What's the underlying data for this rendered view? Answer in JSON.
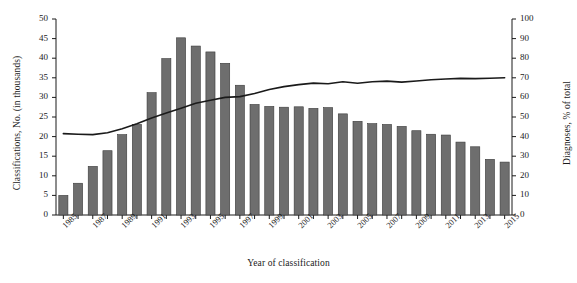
{
  "chart_data": {
    "type": "bar",
    "title": "",
    "xlabel": "Year of classification",
    "ylabel": "Classifications, No. (in thousands)",
    "ylabel_right": "Diagnoses, % of total",
    "ylim": [
      0,
      50
    ],
    "ylim_right": [
      0,
      100
    ],
    "yticks": [
      0,
      5,
      10,
      15,
      20,
      25,
      30,
      35,
      40,
      45,
      50
    ],
    "yticks_right": [
      0,
      10,
      20,
      30,
      40,
      50,
      60,
      70,
      80,
      90,
      100
    ],
    "grid": false,
    "legend": "none",
    "categories": [
      1985,
      1986,
      1987,
      1988,
      1989,
      1990,
      1991,
      1992,
      1993,
      1994,
      1995,
      1996,
      1997,
      1998,
      1999,
      2000,
      2001,
      2002,
      2003,
      2004,
      2005,
      2006,
      2007,
      2008,
      2009,
      2010,
      2011,
      2012,
      2013,
      2014,
      2015
    ],
    "xtick_labels": [
      "1985",
      "1987",
      "1989",
      "1991",
      "1993",
      "1995",
      "1997",
      "1999",
      "2001",
      "2003",
      "2005",
      "2007",
      "2009",
      "2011",
      "2013",
      "2015"
    ],
    "series": [
      {
        "name": "Classifications, No. (in thousands)",
        "type": "bar",
        "axis": "left",
        "color": "#6e6e6e",
        "values": [
          5.0,
          8.1,
          12.4,
          16.4,
          20.5,
          23.1,
          31.2,
          39.9,
          45.2,
          43.1,
          41.6,
          38.7,
          33.1,
          28.2,
          27.7,
          27.5,
          27.6,
          27.2,
          27.4,
          25.8,
          23.9,
          23.3,
          23.1,
          22.6,
          21.5,
          20.6,
          20.4,
          18.6,
          17.4,
          14.2,
          13.5
        ]
      },
      {
        "name": "Diagnoses, % of total",
        "type": "line",
        "axis": "right",
        "color": "#1a1a1a",
        "values": [
          41.5,
          41.2,
          41.0,
          42.0,
          44.0,
          46.5,
          49.5,
          52.0,
          54.5,
          57.0,
          58.5,
          60.0,
          60.4,
          62.0,
          64.0,
          65.5,
          66.5,
          67.3,
          67.0,
          68.0,
          67.2,
          68.0,
          68.3,
          67.8,
          68.4,
          69.0,
          69.4,
          69.7,
          69.6,
          69.8,
          70.0
        ]
      }
    ]
  },
  "plot": {
    "left": 56,
    "right": 512,
    "top": 19,
    "bottom": 215
  }
}
